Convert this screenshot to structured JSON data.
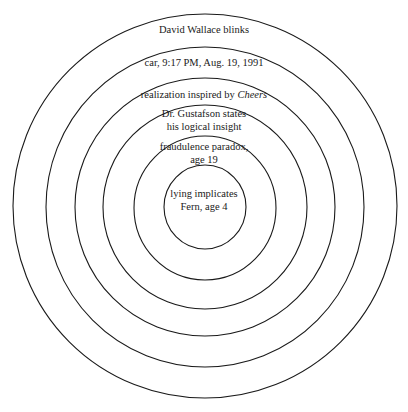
{
  "diagram": {
    "type": "concentric-circles",
    "stroke_color": "#1a1a1a",
    "rings": [
      {
        "label": "David Wallace blinks"
      },
      {
        "label": "car, 9:17 PM, Aug. 19, 1991"
      },
      {
        "label_prefix": "realization inspired by ",
        "label_italic": "Cheers"
      },
      {
        "label_line1": "Dr. Gustafson states",
        "label_line2": "his logical insight"
      },
      {
        "label_line1": "fraudulence paradox,",
        "label_line2": "age 19"
      },
      {
        "label_line1": "lying implicates",
        "label_line2": "Fern, age 4"
      }
    ]
  }
}
